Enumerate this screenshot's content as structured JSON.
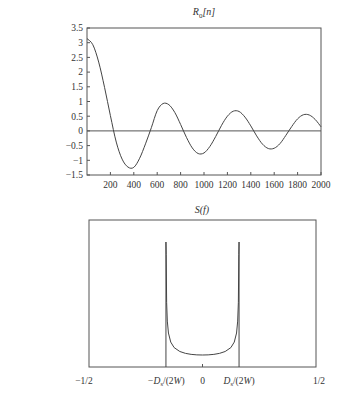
{
  "chart_data": [
    {
      "type": "line",
      "title": "R_0[n]",
      "title_main": "R",
      "title_sub": "0",
      "title_arg": "[n]",
      "xlabel": "",
      "ylabel": "",
      "xlim": [
        0,
        2000
      ],
      "ylim": [
        -1.5,
        3.5
      ],
      "grid": false,
      "x_ticks": [
        200,
        400,
        600,
        800,
        1000,
        1200,
        1400,
        1600,
        1800,
        2000
      ],
      "x_tick_labels": [
        "200",
        "400",
        "600",
        "800",
        "1000",
        "1200",
        "1400",
        "1600",
        "1800",
        "2000"
      ],
      "y_ticks": [
        3.5,
        3,
        2.5,
        2,
        1.5,
        1,
        0.5,
        0,
        -0.5,
        -1,
        -1.5
      ],
      "y_tick_labels": [
        "3.5",
        "3",
        "2.5",
        "2",
        "1.5",
        "1",
        "0.5",
        "0",
        "−0.5",
        "−1",
        "−1.5"
      ],
      "reference_line_y": 0,
      "series": [
        {
          "name": "R_0[n]",
          "x": [
            0,
            50,
            100,
            150,
            200,
            250,
            300,
            350,
            400,
            450,
            500,
            550,
            600,
            650,
            700,
            750,
            800,
            850,
            900,
            950,
            1000,
            1050,
            1100,
            1150,
            1200,
            1250,
            1300,
            1350,
            1400,
            1450,
            1500,
            1550,
            1600,
            1650,
            1700,
            1750,
            1800,
            1850,
            1900,
            1950,
            2000
          ],
          "values": [
            3.14,
            2.93,
            2.34,
            1.48,
            0.52,
            -0.38,
            -0.96,
            -1.23,
            -1.24,
            -0.93,
            -0.44,
            0.11,
            0.69,
            0.93,
            0.89,
            0.63,
            0.22,
            -0.22,
            -0.58,
            -0.77,
            -0.75,
            -0.53,
            -0.19,
            0.19,
            0.5,
            0.67,
            0.66,
            0.47,
            0.17,
            -0.17,
            -0.45,
            -0.6,
            -0.59,
            -0.43,
            -0.15,
            0.15,
            0.41,
            0.55,
            0.54,
            0.39,
            0.14
          ]
        }
      ]
    },
    {
      "type": "line",
      "title": "S(f)",
      "xlabel": "",
      "ylabel": "",
      "xlim": [
        -0.5,
        0.5
      ],
      "grid": false,
      "x_ticks": [
        -0.5,
        -0.161,
        0,
        0.161,
        0.5
      ],
      "x_tick_labels": [
        "−1/2",
        "−D_s/(2W)",
        "0",
        "D_s/(2W)",
        "1/2"
      ],
      "band_edge": 0.161,
      "series": [
        {
          "name": "S(f)",
          "x": [
            -0.161,
            -0.16,
            -0.158,
            -0.155,
            -0.15,
            -0.14,
            -0.125,
            -0.1,
            -0.075,
            -0.05,
            -0.025,
            0,
            0.025,
            0.05,
            0.075,
            0.1,
            0.125,
            0.14,
            0.15,
            0.155,
            0.158,
            0.16,
            0.161
          ],
          "values": [
            10.0,
            9.0,
            5.2,
            3.7,
            2.75,
            2.03,
            1.59,
            1.28,
            1.13,
            1.05,
            1.01,
            1.0,
            1.01,
            1.05,
            1.13,
            1.28,
            1.59,
            2.03,
            2.75,
            3.7,
            5.2,
            9.0,
            10.0
          ]
        }
      ]
    }
  ]
}
